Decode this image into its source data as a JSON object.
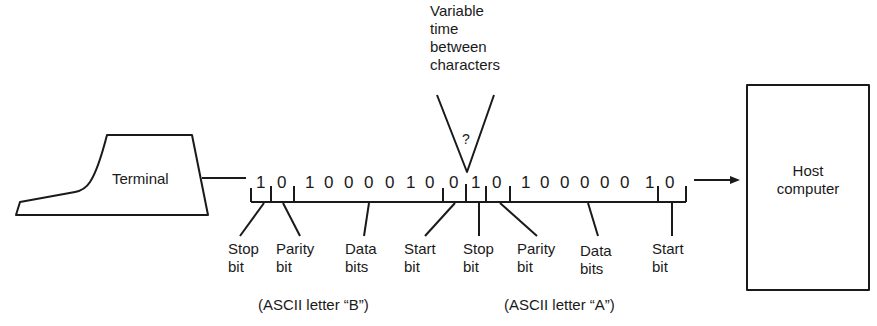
{
  "diagram": {
    "title_note": "Variable time between characters",
    "variable_time_lines": [
      "Variable",
      "time",
      "between",
      "characters"
    ],
    "question_mark": "?",
    "terminal_label": "Terminal",
    "host_label_lines": [
      "Host",
      "computer"
    ],
    "character_B": {
      "caption": "(ASCII letter “B”)",
      "bits": [
        "1",
        "0",
        "1",
        "0",
        "0",
        "0",
        "0",
        "1",
        "0",
        "0"
      ],
      "stop_bit": "1",
      "parity_bit": "0",
      "data_bits": "1000010",
      "start_bit": "0"
    },
    "character_A": {
      "caption": "(ASCII letter “A”)",
      "bits": [
        "1",
        "0",
        "1",
        "0",
        "0",
        "0",
        "0",
        "0",
        "1",
        "0"
      ],
      "stop_bit": "1",
      "parity_bit": "0",
      "data_bits": "1000001",
      "start_bit": "0"
    },
    "field_labels": {
      "stop": [
        "Stop",
        "bit"
      ],
      "parity": [
        "Parity",
        "bit"
      ],
      "data": [
        "Data",
        "bits"
      ],
      "start": [
        "Start",
        "bit"
      ]
    },
    "direction": "Terminal → Host computer"
  }
}
